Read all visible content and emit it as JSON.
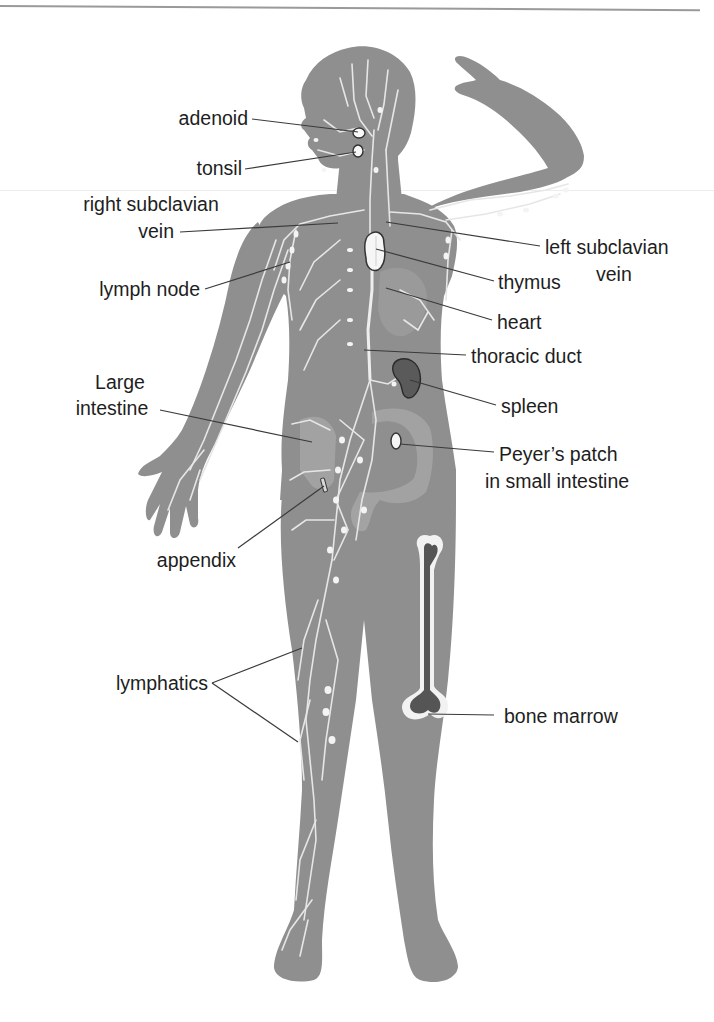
{
  "figure": {
    "colors": {
      "body": "#8f8f8f",
      "body_light": "#a8a8a8",
      "lymph_vessels": "#e6e6e6",
      "nodes": "#f4f4f4",
      "spleen": "#5a5a5a",
      "marrow": "#555555",
      "leader_lines": "#3a3a3a",
      "text": "#1e1e1e"
    }
  },
  "labels": {
    "adenoid": "adenoid",
    "tonsil": "tonsil",
    "right_subclavian_line1": "right subclavian",
    "right_subclavian_line2": "vein",
    "left_subclavian_line1": "left subclavian",
    "left_subclavian_line2": "vein",
    "lymph_node": "lymph node",
    "thymus": "thymus",
    "heart": "heart",
    "thoracic_duct": "thoracic duct",
    "large_intestine_line1": "Large",
    "large_intestine_line2": "intestine",
    "spleen": "spleen",
    "peyers_patch_line1": "Peyer’s patch",
    "peyers_patch_line2": "in small intestine",
    "appendix": "appendix",
    "lymphatics": "lymphatics",
    "bone_marrow": "bone marrow"
  }
}
